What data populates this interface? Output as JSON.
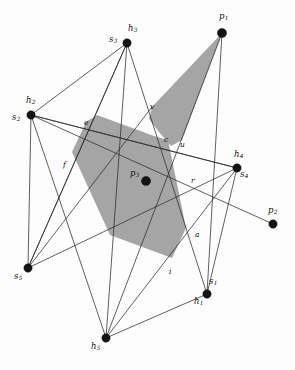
{
  "figure": {
    "kind": "geometric-diagram",
    "background_color": "#fdfdfd",
    "line_color": "#2b2b2b",
    "shade_color": "#9d9d9d",
    "dot_color": "#141414",
    "width": 295,
    "height": 370
  },
  "points": [
    {
      "id": "h3s3",
      "x": 127,
      "y": 43,
      "r": 4.2
    },
    {
      "id": "p1",
      "x": 222,
      "y": 33,
      "r": 4.6
    },
    {
      "id": "h2s2",
      "x": 31,
      "y": 115,
      "r": 4.2
    },
    {
      "id": "h4s4",
      "x": 237,
      "y": 168,
      "r": 4.2
    },
    {
      "id": "p3",
      "x": 146,
      "y": 181,
      "r": 4.6
    },
    {
      "id": "p2",
      "x": 273,
      "y": 224,
      "r": 4.2
    },
    {
      "id": "s5",
      "x": 28,
      "y": 268,
      "r": 4.2
    },
    {
      "id": "h1s1",
      "x": 207,
      "y": 294,
      "r": 4.2
    },
    {
      "id": "h5",
      "x": 106,
      "y": 338,
      "r": 4.2
    }
  ],
  "point_labels": [
    {
      "id": "label-h3",
      "base": "h",
      "sub": "3",
      "x": 128,
      "y": 24
    },
    {
      "id": "label-s3",
      "base": "s",
      "sub": "3",
      "x": 109,
      "y": 35
    },
    {
      "id": "label-p1",
      "base": "p",
      "sub": "1",
      "x": 219,
      "y": 12
    },
    {
      "id": "label-h2",
      "base": "h",
      "sub": "2",
      "x": 26,
      "y": 96
    },
    {
      "id": "label-s2",
      "base": "s",
      "sub": "2",
      "x": 12,
      "y": 113
    },
    {
      "id": "label-h4",
      "base": "h",
      "sub": "4",
      "x": 234,
      "y": 150
    },
    {
      "id": "label-s4",
      "base": "s",
      "sub": "4",
      "x": 240,
      "y": 170
    },
    {
      "id": "label-p3",
      "base": "p",
      "sub": "3",
      "x": 130,
      "y": 169
    },
    {
      "id": "label-p2",
      "base": "p",
      "sub": "2",
      "x": 268,
      "y": 206
    },
    {
      "id": "label-s5",
      "base": "s",
      "sub": "5",
      "x": 14,
      "y": 272
    },
    {
      "id": "label-s1",
      "base": "s",
      "sub": "1",
      "x": 209,
      "y": 277
    },
    {
      "id": "label-h1",
      "base": "h",
      "sub": "1",
      "x": 194,
      "y": 297
    },
    {
      "id": "label-h5",
      "base": "h",
      "sub": "5",
      "x": 91,
      "y": 342
    }
  ],
  "edge_labels": [
    {
      "id": "label-e",
      "text": "e",
      "x": 84,
      "y": 119
    },
    {
      "id": "label-v",
      "text": "v",
      "x": 150,
      "y": 103
    },
    {
      "id": "label-c",
      "text": "c",
      "x": 164,
      "y": 136
    },
    {
      "id": "label-u",
      "text": "u",
      "x": 180,
      "y": 141
    },
    {
      "id": "label-f",
      "text": "f",
      "x": 63,
      "y": 161
    },
    {
      "id": "label-r",
      "text": "r",
      "x": 191,
      "y": 177
    },
    {
      "id": "label-a",
      "text": "a",
      "x": 195,
      "y": 231
    },
    {
      "id": "label-i",
      "text": "i",
      "x": 169,
      "y": 268
    }
  ],
  "shaded_regions": [
    {
      "id": "shade-wedge-p1",
      "points": "222,33 152,107 149,119 159,132 171,146 182,140"
    },
    {
      "id": "shade-main-polygon",
      "points": "86,122 72,152 110,235 172,258 186,228 168,140 154,136 97,115"
    }
  ],
  "segments": [
    {
      "id": "seg-s3-h5",
      "x1": 127,
      "y1": 43,
      "x2": 106,
      "y2": 338
    },
    {
      "id": "seg-s3-s5",
      "x1": 127,
      "y1": 43,
      "x2": 28,
      "y2": 268
    },
    {
      "id": "seg-s3-h1",
      "x1": 127,
      "y1": 43,
      "x2": 207,
      "y2": 294
    },
    {
      "id": "seg-s3-s2",
      "x1": 127,
      "y1": 43,
      "x2": 31,
      "y2": 115
    },
    {
      "id": "seg-p1-h5",
      "x1": 222,
      "y1": 33,
      "x2": 106,
      "y2": 338
    },
    {
      "id": "seg-p1-h1",
      "x1": 222,
      "y1": 33,
      "x2": 207,
      "y2": 294
    },
    {
      "id": "seg-s2-h4",
      "x1": 31,
      "y1": 115,
      "x2": 237,
      "y2": 168
    },
    {
      "id": "seg-s2-p2",
      "x1": 31,
      "y1": 115,
      "x2": 273,
      "y2": 224
    },
    {
      "id": "seg-s2-h5",
      "x1": 31,
      "y1": 115,
      "x2": 106,
      "y2": 338
    },
    {
      "id": "seg-s2-s5",
      "x1": 31,
      "y1": 115,
      "x2": 28,
      "y2": 268
    },
    {
      "id": "seg-s5-h4",
      "x1": 28,
      "y1": 268,
      "x2": 237,
      "y2": 168
    },
    {
      "id": "seg-s5-h3",
      "x1": 28,
      "y1": 268,
      "x2": 127,
      "y2": 43
    },
    {
      "id": "seg-h4-h5",
      "x1": 237,
      "y1": 168,
      "x2": 106,
      "y2": 338
    },
    {
      "id": "seg-h4-h1",
      "x1": 237,
      "y1": 168,
      "x2": 207,
      "y2": 294
    },
    {
      "id": "seg-h4-s2b",
      "x1": 237,
      "y1": 168,
      "x2": 31,
      "y2": 115
    },
    {
      "id": "seg-h5-h1",
      "x1": 106,
      "y1": 338,
      "x2": 207,
      "y2": 294
    },
    {
      "id": "seg-s5-p1x",
      "x1": 28,
      "y1": 268,
      "x2": 152,
      "y2": 107
    }
  ]
}
